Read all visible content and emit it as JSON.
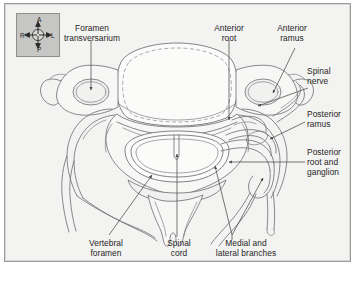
{
  "figure": {
    "kind": "anatomical-diagram",
    "panel_background": "#f3f3f1",
    "panel_border": "#9a9a9a",
    "line_color": "#6f6f74",
    "label_color": "#262626"
  },
  "compass": {
    "name": "orientation-compass",
    "background": "#c6c6c4",
    "border": "#8e8e8c",
    "anterior": "A",
    "posterior": "P",
    "right": "R",
    "left": "L"
  },
  "labels": {
    "foramen_transversarium": "Foramen\ntransversarium",
    "anterior_root": "Anterior\nroot",
    "anterior_ramus": "Anterior\nramus",
    "spinal_nerve": "Spinal\nnerve",
    "posterior_ramus": "Posterior\nramus",
    "posterior_root_and_ganglion": "Posterior\nroot and\nganglion",
    "vertebral_foramen": "Vertebral\nforamen",
    "spinal_cord": "Spinal\ncord",
    "medial_and_lateral_branches": "Medial and\nlateral branches"
  },
  "structures": [
    {
      "name": "vertebral-body",
      "fill": "#fbfbfa"
    },
    {
      "name": "foramen-transversarium-left",
      "fill": "#f0f0ee"
    },
    {
      "name": "foramen-transversarium-right",
      "fill": "#f0f0ee"
    },
    {
      "name": "vertebral-foramen",
      "fill": "#fbfbfa"
    },
    {
      "name": "spinal-cord",
      "fill": "#fcfcfb"
    },
    {
      "name": "spinous-process",
      "fill": "#f3f3f1"
    },
    {
      "name": "transverse-process-left",
      "fill": "#f3f3f1"
    },
    {
      "name": "transverse-process-right",
      "fill": "#f3f3f1"
    },
    {
      "name": "spinal-nerve-trunk",
      "fill": "none"
    },
    {
      "name": "posterior-ramus-branch",
      "fill": "none"
    },
    {
      "name": "anterior-ramus-branch",
      "fill": "none"
    },
    {
      "name": "medial-branch",
      "fill": "none"
    },
    {
      "name": "lateral-branch",
      "fill": "none"
    }
  ]
}
